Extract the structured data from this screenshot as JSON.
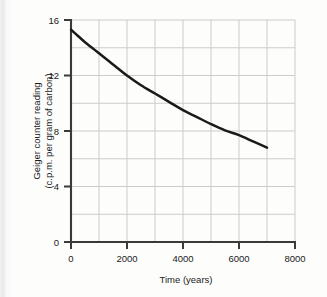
{
  "chart_data": {
    "type": "line",
    "title": "",
    "xlabel": "Time (years)",
    "ylabel_line1": "Geiger counter  reading",
    "ylabel_line2": "(c.p.m. per gram of carbon)",
    "ylabel": "Geiger counter reading (c.p.m. per gram of carbon)",
    "xlim": [
      0,
      8000
    ],
    "ylim": [
      0,
      16
    ],
    "xticks": [
      0,
      2000,
      4000,
      6000,
      8000
    ],
    "xtick_labels": [
      "0",
      "2000",
      "4000",
      "6000",
      "8000"
    ],
    "yticks": [
      0,
      4,
      8,
      12,
      16
    ],
    "ytick_labels": [
      "0",
      "4",
      "8",
      "12",
      "16"
    ],
    "x_minor_step": 1000,
    "y_minor_step": 2,
    "grid": true,
    "grid_color": "#cccccc",
    "legend": "none",
    "line_color": "#1a1a1a",
    "axis_color": "#333333",
    "background_color": "#fdfdfc",
    "series": [
      {
        "name": "carbon-14 decay",
        "x": [
          0,
          250,
          500,
          750,
          1000,
          1500,
          2000,
          2500,
          3000,
          3500,
          4000,
          4500,
          5000,
          5500,
          6000,
          6500,
          7000
        ],
        "y": [
          15.3,
          14.85,
          14.4,
          14.0,
          13.6,
          12.8,
          12.0,
          11.3,
          10.7,
          10.1,
          9.5,
          9.0,
          8.5,
          8.05,
          7.7,
          7.25,
          6.8
        ]
      }
    ],
    "annotations": []
  }
}
